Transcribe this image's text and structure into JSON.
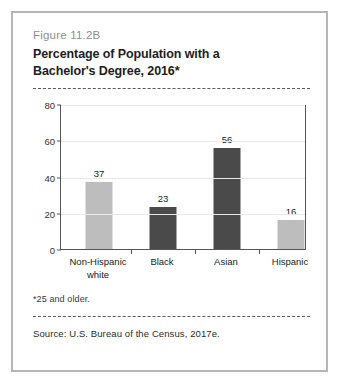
{
  "figure": {
    "number": "Figure 11.2B",
    "title_line1": "Percentage of Population with a",
    "title_line2": "Bachelor's Degree, 2016*",
    "footnote": "*25 and older.",
    "source": "Source: U.S. Bureau of the Census, 2017e."
  },
  "colors": {
    "bar_light": "#bdbdbd",
    "bar_dark": "#4a4a4a",
    "axis": "#555555",
    "grid": "#e8e8e8",
    "frame": "#b6b6b6"
  },
  "chart_data": {
    "type": "bar",
    "title": "Percentage of Population with a Bachelor's Degree, 2016*",
    "xlabel": "",
    "ylabel": "",
    "ylim": [
      0,
      80
    ],
    "yticks": [
      0,
      20,
      40,
      60,
      80
    ],
    "grid": true,
    "legend": "none",
    "categories": [
      "Non-Hispanic white",
      "Black",
      "Asian",
      "Hispanic"
    ],
    "category_lines": [
      [
        "Non-Hispanic",
        "white"
      ],
      [
        "Black"
      ],
      [
        "Asian"
      ],
      [
        "Hispanic"
      ]
    ],
    "values": [
      37,
      23,
      56,
      16
    ],
    "value_labels": [
      "37",
      "23",
      "56",
      "16"
    ],
    "bar_colors": [
      "#bdbdbd",
      "#4a4a4a",
      "#4a4a4a",
      "#bdbdbd"
    ],
    "ytick_labels": [
      "0",
      "20",
      "40",
      "60",
      "80"
    ]
  }
}
